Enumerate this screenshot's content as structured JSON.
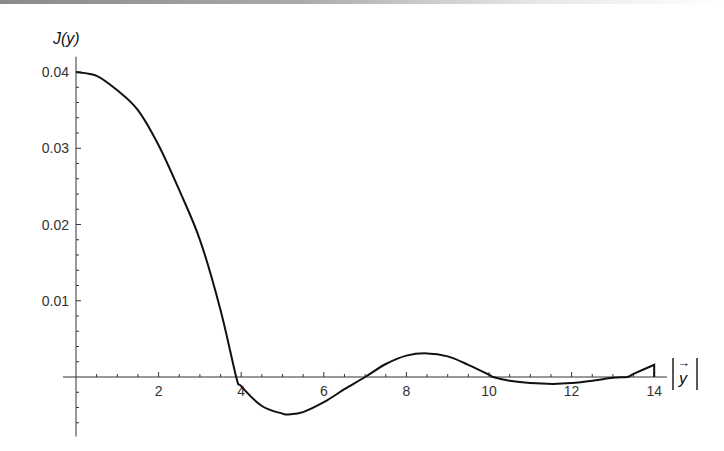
{
  "chart_data": {
    "type": "line",
    "title": "",
    "xlabel": "|y⃗|",
    "ylabel": "J(y)",
    "xlim": [
      -0.3,
      14.3
    ],
    "ylim": [
      -0.0078,
      0.042
    ],
    "grid": false,
    "legend": null,
    "x_ticks": [
      2,
      4,
      6,
      8,
      10,
      12,
      14
    ],
    "x_tick_labels": [
      "2",
      "4",
      "6",
      "8",
      "10",
      "12",
      "14"
    ],
    "y_ticks": [
      0.01,
      0.02,
      0.03,
      0.04
    ],
    "y_tick_labels": [
      "0.01",
      "0.02",
      "0.03",
      "0.04"
    ],
    "series": [
      {
        "name": "J(y)",
        "color": "#111111",
        "x": [
          0,
          0.5,
          1,
          1.5,
          2,
          2.5,
          3,
          3.5,
          3.88,
          4,
          4.5,
          5,
          5.15,
          5.5,
          6,
          6.5,
          7,
          7.5,
          8,
          8.5,
          9,
          9.5,
          10,
          10.1,
          10.5,
          11,
          11.55,
          12,
          12.5,
          13,
          13.35,
          13.5,
          14
        ],
        "y": [
          0.04,
          0.0395,
          0.0376,
          0.035,
          0.0304,
          0.0245,
          0.018,
          0.0088,
          0.0,
          -0.0012,
          -0.0038,
          -0.0048,
          -0.0049,
          -0.0046,
          -0.0033,
          -0.0016,
          0.0,
          0.0017,
          0.0028,
          0.0031,
          0.0027,
          0.0016,
          0.0003,
          0.0,
          -0.0005,
          -0.0008,
          -0.0009,
          -0.0008,
          -0.0005,
          -0.0001,
          0.0,
          0.0004,
          0.0016
        ]
      }
    ]
  },
  "labels": {
    "y_axis_title": "J(y)",
    "x_axis_title_vector": "y",
    "x_axis_arrow": "→",
    "x_ticks": [
      "2",
      "4",
      "6",
      "8",
      "10",
      "12",
      "14"
    ],
    "y_ticks": [
      "0.01",
      "0.02",
      "0.03",
      "0.04"
    ]
  }
}
